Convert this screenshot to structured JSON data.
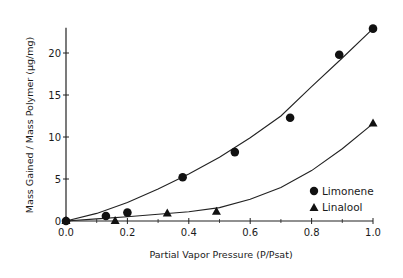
{
  "chart_data": {
    "type": "scatter",
    "title": "",
    "xlabel": "Partial Vapor Pressure (P/Psat)",
    "ylabel": "Mass Gained / Mass Polymer (µg/mg)",
    "xlim": [
      0.0,
      1.0
    ],
    "ylim": [
      0,
      23
    ],
    "x_ticks": [
      0.0,
      0.2,
      0.4,
      0.6,
      0.8,
      1.0
    ],
    "x_tick_labels": [
      "0.0",
      "0.2",
      "0.4",
      "0.6",
      "0.8",
      "1.0"
    ],
    "x_minor_ticks": [
      0.1,
      0.3,
      0.5,
      0.7,
      0.9
    ],
    "y_ticks": [
      0,
      5,
      10,
      15,
      20
    ],
    "y_tick_labels": [
      "0",
      "5",
      "10",
      "15",
      "20"
    ],
    "grid": false,
    "legend_position": "bottom-right",
    "series": [
      {
        "name": "Limonene",
        "marker": "circle",
        "x": [
          0.0,
          0.13,
          0.2,
          0.38,
          0.55,
          0.73,
          0.89,
          1.0
        ],
        "y": [
          0.0,
          0.6,
          1.0,
          5.2,
          8.2,
          12.3,
          19.8,
          22.9
        ],
        "fit": "quadratic",
        "fit_curve": {
          "x": [
            0.0,
            0.1,
            0.2,
            0.3,
            0.4,
            0.5,
            0.6,
            0.7,
            0.8,
            0.9,
            1.0
          ],
          "y": [
            0.0,
            0.9,
            2.2,
            3.8,
            5.6,
            7.6,
            9.9,
            12.5,
            16.0,
            19.4,
            22.9
          ]
        }
      },
      {
        "name": "Linalool",
        "marker": "triangle",
        "x": [
          0.0,
          0.16,
          0.33,
          0.49,
          1.0
        ],
        "y": [
          0.0,
          0.0,
          0.9,
          1.1,
          11.6
        ],
        "fit": "curve",
        "fit_curve": {
          "x": [
            0.0,
            0.1,
            0.2,
            0.3,
            0.4,
            0.5,
            0.6,
            0.7,
            0.8,
            0.9,
            1.0
          ],
          "y": [
            0.0,
            0.25,
            0.5,
            0.8,
            1.1,
            1.6,
            2.6,
            4.0,
            6.0,
            8.6,
            11.6
          ]
        }
      }
    ]
  }
}
